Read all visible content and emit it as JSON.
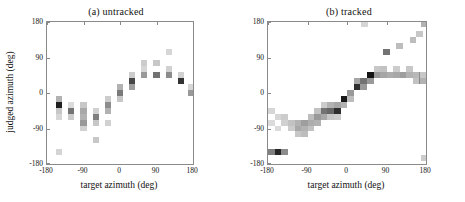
{
  "figure": {
    "type": "two-panel-heatmap",
    "colormap": "grayscale-inverted"
  },
  "panels": [
    {
      "id": "a",
      "title": "(a) untracked",
      "show_ylabel": true
    },
    {
      "id": "b",
      "title": "(b) tracked",
      "show_ylabel": false
    }
  ],
  "axes": {
    "xlabel": "target azimuth (deg)",
    "ylabel": "judged azimuth (deg)",
    "xticks": [
      -180,
      -90,
      0,
      90,
      180
    ],
    "xticklabels": [
      "-180",
      "-90",
      "0",
      "90",
      "180"
    ],
    "yticks": [
      -180,
      -90,
      0,
      90,
      180
    ],
    "yticklabels": [
      "-180",
      "-90",
      "0",
      "90",
      "180"
    ],
    "xlim": [
      -180,
      180
    ],
    "ylim": [
      -180,
      180
    ],
    "grid": false
  },
  "chart_data": [
    {
      "type": "heatmap",
      "panel": "a",
      "title": "(a) untracked",
      "xlabel": "target azimuth (deg)",
      "ylabel": "judged azimuth (deg)",
      "xlim": [
        -180,
        180
      ],
      "ylim": [
        -180,
        180
      ],
      "bin_width": 15,
      "bin_height": 15,
      "value_range": [
        0,
        1
      ],
      "colormap": "grayscale-inverted",
      "grid": false,
      "cells": [
        {
          "x": -150,
          "y": -30,
          "v": 0.88
        },
        {
          "x": -150,
          "y": -15,
          "v": 0.3
        },
        {
          "x": -150,
          "y": -45,
          "v": 0.22
        },
        {
          "x": -150,
          "y": -60,
          "v": 0.16
        },
        {
          "x": -150,
          "y": -150,
          "v": 0.17
        },
        {
          "x": -120,
          "y": -45,
          "v": 0.55
        },
        {
          "x": -120,
          "y": -60,
          "v": 0.2
        },
        {
          "x": -120,
          "y": -30,
          "v": 0.14
        },
        {
          "x": -90,
          "y": -45,
          "v": 0.34
        },
        {
          "x": -90,
          "y": -60,
          "v": 0.3
        },
        {
          "x": -90,
          "y": -75,
          "v": 0.4
        },
        {
          "x": -90,
          "y": -30,
          "v": 0.22
        },
        {
          "x": -90,
          "y": -90,
          "v": 0.18
        },
        {
          "x": -60,
          "y": -60,
          "v": 0.5
        },
        {
          "x": -60,
          "y": -75,
          "v": 0.22
        },
        {
          "x": -60,
          "y": -45,
          "v": 0.18
        },
        {
          "x": -60,
          "y": -120,
          "v": 0.22
        },
        {
          "x": -30,
          "y": -30,
          "v": 0.45
        },
        {
          "x": -30,
          "y": -45,
          "v": 0.3
        },
        {
          "x": -30,
          "y": -15,
          "v": 0.2
        },
        {
          "x": -30,
          "y": -75,
          "v": 0.18
        },
        {
          "x": 0,
          "y": 0,
          "v": 0.52
        },
        {
          "x": 0,
          "y": 15,
          "v": 0.3
        },
        {
          "x": 0,
          "y": -15,
          "v": 0.22
        },
        {
          "x": 30,
          "y": 30,
          "v": 0.72
        },
        {
          "x": 30,
          "y": 15,
          "v": 0.38
        },
        {
          "x": 30,
          "y": 45,
          "v": 0.2
        },
        {
          "x": 60,
          "y": 45,
          "v": 0.4
        },
        {
          "x": 60,
          "y": 75,
          "v": 0.2
        },
        {
          "x": 60,
          "y": 60,
          "v": 0.16
        },
        {
          "x": 90,
          "y": 45,
          "v": 0.55
        },
        {
          "x": 90,
          "y": 75,
          "v": 0.22
        },
        {
          "x": 120,
          "y": 45,
          "v": 0.45
        },
        {
          "x": 120,
          "y": 60,
          "v": 0.18
        },
        {
          "x": 120,
          "y": 105,
          "v": 0.16
        },
        {
          "x": 150,
          "y": 30,
          "v": 0.8
        },
        {
          "x": 150,
          "y": 45,
          "v": 0.18
        },
        {
          "x": 175,
          "y": 0,
          "v": 0.4
        },
        {
          "x": 175,
          "y": 15,
          "v": 0.16
        }
      ]
    },
    {
      "type": "heatmap",
      "panel": "b",
      "title": "(b) tracked",
      "xlabel": "target azimuth (deg)",
      "ylabel": "judged azimuth (deg)",
      "xlim": [
        -180,
        180
      ],
      "ylim": [
        -180,
        180
      ],
      "bin_width": 15,
      "bin_height": 15,
      "value_range": [
        0,
        1
      ],
      "colormap": "grayscale-inverted",
      "grid": false,
      "cells": [
        {
          "x": -172,
          "y": -150,
          "v": 0.5
        },
        {
          "x": -157,
          "y": -150,
          "v": 0.85
        },
        {
          "x": -142,
          "y": -150,
          "v": 0.45
        },
        {
          "x": -172,
          "y": -45,
          "v": 0.16
        },
        {
          "x": -172,
          "y": -75,
          "v": 0.14
        },
        {
          "x": -157,
          "y": -60,
          "v": 0.16
        },
        {
          "x": -157,
          "y": -90,
          "v": 0.14
        },
        {
          "x": -142,
          "y": -60,
          "v": 0.2
        },
        {
          "x": -142,
          "y": -75,
          "v": 0.18
        },
        {
          "x": -127,
          "y": -75,
          "v": 0.24
        },
        {
          "x": -127,
          "y": -90,
          "v": 0.2
        },
        {
          "x": -112,
          "y": -75,
          "v": 0.3
        },
        {
          "x": -112,
          "y": -90,
          "v": 0.34
        },
        {
          "x": -112,
          "y": -105,
          "v": 0.22
        },
        {
          "x": -97,
          "y": -75,
          "v": 0.38
        },
        {
          "x": -97,
          "y": -90,
          "v": 0.3
        },
        {
          "x": -97,
          "y": -105,
          "v": 0.26
        },
        {
          "x": -82,
          "y": -75,
          "v": 0.32
        },
        {
          "x": -82,
          "y": -90,
          "v": 0.24
        },
        {
          "x": -82,
          "y": -60,
          "v": 0.26
        },
        {
          "x": -67,
          "y": -60,
          "v": 0.4
        },
        {
          "x": -67,
          "y": -75,
          "v": 0.3
        },
        {
          "x": -67,
          "y": -45,
          "v": 0.24
        },
        {
          "x": -52,
          "y": -45,
          "v": 0.55
        },
        {
          "x": -52,
          "y": -60,
          "v": 0.34
        },
        {
          "x": -52,
          "y": -30,
          "v": 0.2
        },
        {
          "x": -37,
          "y": -45,
          "v": 0.6
        },
        {
          "x": -37,
          "y": -30,
          "v": 0.3
        },
        {
          "x": -37,
          "y": -60,
          "v": 0.22
        },
        {
          "x": -22,
          "y": -45,
          "v": 0.82
        },
        {
          "x": -22,
          "y": -30,
          "v": 0.35
        },
        {
          "x": -22,
          "y": -60,
          "v": 0.2
        },
        {
          "x": -7,
          "y": -15,
          "v": 0.9
        },
        {
          "x": -7,
          "y": -30,
          "v": 0.3
        },
        {
          "x": 8,
          "y": 0,
          "v": 0.4
        },
        {
          "x": 8,
          "y": -15,
          "v": 0.26
        },
        {
          "x": 23,
          "y": 15,
          "v": 0.82
        },
        {
          "x": 23,
          "y": 30,
          "v": 0.35
        },
        {
          "x": 38,
          "y": 30,
          "v": 0.55
        },
        {
          "x": 38,
          "y": 15,
          "v": 0.4
        },
        {
          "x": 53,
          "y": 45,
          "v": 0.92
        },
        {
          "x": 53,
          "y": 30,
          "v": 0.4
        },
        {
          "x": 68,
          "y": 45,
          "v": 0.4
        },
        {
          "x": 68,
          "y": 60,
          "v": 0.22
        },
        {
          "x": 83,
          "y": 45,
          "v": 0.35
        },
        {
          "x": 83,
          "y": 60,
          "v": 0.24
        },
        {
          "x": 90,
          "y": 105,
          "v": 0.55
        },
        {
          "x": 98,
          "y": 45,
          "v": 0.32
        },
        {
          "x": 113,
          "y": 45,
          "v": 0.34
        },
        {
          "x": 113,
          "y": 60,
          "v": 0.2
        },
        {
          "x": 120,
          "y": 120,
          "v": 0.26
        },
        {
          "x": 128,
          "y": 45,
          "v": 0.38
        },
        {
          "x": 143,
          "y": 45,
          "v": 0.3
        },
        {
          "x": 143,
          "y": 60,
          "v": 0.22
        },
        {
          "x": 150,
          "y": 135,
          "v": 0.26
        },
        {
          "x": 158,
          "y": 45,
          "v": 0.28
        },
        {
          "x": 158,
          "y": 30,
          "v": 0.24
        },
        {
          "x": 165,
          "y": 150,
          "v": 0.22
        },
        {
          "x": 172,
          "y": 30,
          "v": 0.3
        },
        {
          "x": 172,
          "y": 45,
          "v": 0.22
        },
        {
          "x": 175,
          "y": 175,
          "v": 0.3
        },
        {
          "x": 175,
          "y": -165,
          "v": 0.2
        },
        {
          "x": 40,
          "y": 175,
          "v": 0.16
        }
      ]
    }
  ]
}
